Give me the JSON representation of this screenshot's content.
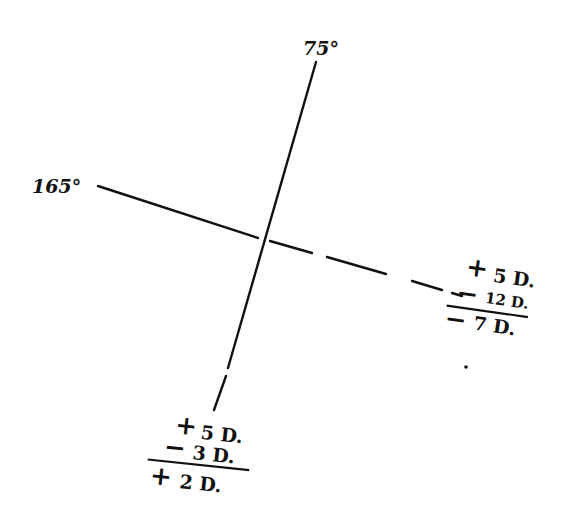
{
  "diagram": {
    "axes": {
      "vertical": {
        "label": "75°",
        "angle_deg": 75
      },
      "horizontal": {
        "label": "165°",
        "angle_deg": 165
      }
    },
    "right_fraction": {
      "line1_sign": "+",
      "line1_value": "5 D.",
      "line2_sign": "−",
      "line2_value": "12 D.",
      "result_sign": "−",
      "result_value": "7 D."
    },
    "bottom_fraction": {
      "line1_sign": "+",
      "line1_value": "5 D.",
      "line2_sign": "−",
      "line2_value": "3 D.",
      "result_sign": "+",
      "result_value": "2 D."
    },
    "colors": {
      "ink": "#111111",
      "background": "#ffffff"
    }
  }
}
